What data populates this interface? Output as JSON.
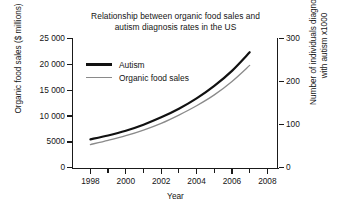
{
  "chart_data": {
    "type": "line",
    "title": "Relationship between organic food sales and autism diagnosis rates in the US",
    "title_lines": [
      "Relationship between organic food sales and",
      "autism diagnosis rates in the US"
    ],
    "xlabel": "Year",
    "ylabel": "Organic food sales ($ millions)",
    "y2label": "Number of individuals diagnosed with autism x1000",
    "y2label_lines": [
      "Number of individuals diagnosed",
      "with autism x1000"
    ],
    "grid": false,
    "legend_position": "upper-left-inside",
    "xlim": [
      1997,
      2008.6
    ],
    "xticks": [
      1998,
      1999,
      2000,
      2001,
      2002,
      2003,
      2004,
      2005,
      2006,
      2007,
      2008
    ],
    "xtick_labels": [
      "1998",
      "",
      "2000",
      "",
      "2002",
      "",
      "2004",
      "",
      "2006",
      "",
      "2008"
    ],
    "xtick_major": [
      1998,
      2000,
      2002,
      2004,
      2006,
      2008
    ],
    "ylim": [
      0,
      25000
    ],
    "yticks": [
      0,
      5000,
      10000,
      15000,
      20000,
      25000
    ],
    "ytick_labels": [
      "0",
      "5000",
      "10 000",
      "15 000",
      "20 000",
      "25 000"
    ],
    "y2lim": [
      0,
      300
    ],
    "y2ticks": [
      0,
      100,
      200,
      300
    ],
    "y2tick_labels": [
      "0",
      "100",
      "200",
      "300"
    ],
    "x": [
      1998,
      1999,
      2000,
      2001,
      2002,
      2003,
      2004,
      2005,
      2006,
      2007
    ],
    "series": [
      {
        "name": "Autism",
        "axis": "right",
        "color": "#111111",
        "linewidth": 2.2,
        "values": [
          66,
          75,
          86,
          100,
          117,
          137,
          161,
          190,
          225,
          268
        ],
        "units": "thousands of individuals diagnosed"
      },
      {
        "name": "Organic food sales",
        "axis": "left",
        "color": "#8a8a8a",
        "linewidth": 1.3,
        "values": [
          4500,
          5300,
          6200,
          7300,
          8600,
          10200,
          12000,
          14100,
          16700,
          19800
        ],
        "units": "$ millions"
      }
    ]
  },
  "legend": {
    "items": [
      {
        "label": "Autism"
      },
      {
        "label": "Organic food sales"
      }
    ]
  }
}
